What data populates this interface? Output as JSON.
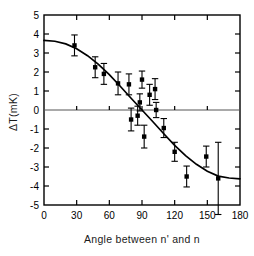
{
  "chart_data": {
    "type": "scatter",
    "title": "",
    "xlabel": "Angle between n' and n",
    "ylabel": "ΔT(mK)",
    "xlim": [
      0,
      180
    ],
    "ylim": [
      -5,
      5
    ],
    "xticks": [
      0,
      30,
      60,
      90,
      120,
      150,
      180
    ],
    "yticks": [
      5,
      4,
      3,
      2,
      1,
      0,
      -1,
      -2,
      -3,
      -4,
      -5
    ],
    "xtick_labels": [
      "0",
      "30",
      "60",
      "90",
      "120",
      "150",
      "180"
    ],
    "ytick_labels": [
      "5",
      "4",
      "3",
      "2",
      "1",
      "0",
      "-1",
      "-2",
      "-3",
      "-4",
      "-5"
    ],
    "grid": false,
    "legend": null,
    "marker": "filled-square",
    "errorbars": true,
    "series": [
      {
        "name": "measured temperature difference",
        "x": [
          28,
          47,
          55,
          68,
          78,
          80,
          86,
          88,
          90,
          92,
          97,
          102,
          103,
          110,
          120,
          131,
          149,
          160
        ],
        "y": [
          3.4,
          2.25,
          1.9,
          1.4,
          1.35,
          -0.5,
          -0.3,
          0.4,
          1.6,
          -1.4,
          0.8,
          1.1,
          0.0,
          -0.95,
          -2.2,
          -3.5,
          -2.45,
          -3.6
        ],
        "yerr": [
          0.55,
          0.55,
          0.55,
          0.6,
          0.55,
          0.6,
          0.5,
          0.45,
          0.45,
          0.6,
          0.55,
          0.55,
          0.4,
          0.5,
          0.5,
          0.55,
          0.55,
          1.9
        ]
      }
    ],
    "fit_curve": {
      "name": "model fit",
      "x": [
        0,
        10,
        20,
        30,
        40,
        50,
        60,
        70,
        80,
        90,
        100,
        110,
        120,
        130,
        140,
        150,
        160,
        170,
        180
      ],
      "y": [
        3.66,
        3.62,
        3.48,
        3.22,
        2.86,
        2.4,
        1.86,
        1.25,
        0.62,
        0.0,
        -0.62,
        -1.25,
        -1.86,
        -2.4,
        -2.86,
        -3.22,
        -3.48,
        -3.58,
        -3.62
      ]
    }
  },
  "figure": {
    "xlabel": "Angle between n' and n",
    "ylabel": "ΔT(mK)"
  }
}
